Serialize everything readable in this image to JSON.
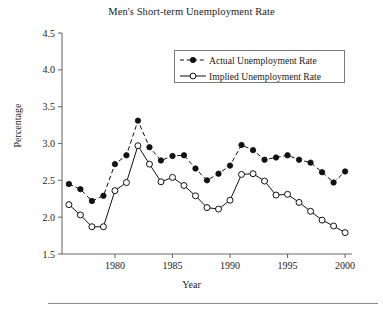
{
  "figure": {
    "title": "Men's Short-term Unemployment Rate",
    "xlabel": "Year",
    "ylabel": "Percentage"
  },
  "legend": {
    "position": "upper-right-inside",
    "entries": [
      {
        "label": "Actual Unemployment Rate",
        "marker": "filled-circle",
        "line": "dashed"
      },
      {
        "label": "Implied Unemployment Rate",
        "marker": "open-circle",
        "line": "solid"
      }
    ]
  },
  "axes": {
    "y_ticks": [
      "1.5",
      "2.0",
      "2.5",
      "3.0",
      "3.5",
      "4.0",
      "4.5"
    ],
    "x_ticks": [
      "1980",
      "1985",
      "1990",
      "1995",
      "2000"
    ]
  },
  "chart_data": {
    "type": "line",
    "title": "Men's Short-term Unemployment Rate",
    "xlabel": "Year",
    "ylabel": "Percentage",
    "xlim": [
      1975.4,
      2000.6
    ],
    "ylim": [
      1.5,
      4.5
    ],
    "grid": false,
    "legend_position": "upper right",
    "x": [
      1976,
      1977,
      1978,
      1979,
      1980,
      1981,
      1982,
      1983,
      1984,
      1985,
      1986,
      1987,
      1988,
      1989,
      1990,
      1991,
      1992,
      1993,
      1994,
      1995,
      1996,
      1997,
      1998,
      1999,
      2000
    ],
    "series": [
      {
        "name": "Actual Unemployment Rate",
        "marker": "filled-circle",
        "linestyle": "dashed",
        "color": "#111111",
        "values": [
          2.45,
          2.38,
          2.22,
          2.29,
          2.72,
          2.84,
          3.31,
          2.95,
          2.77,
          2.83,
          2.84,
          2.66,
          2.5,
          2.59,
          2.7,
          2.98,
          2.91,
          2.78,
          2.81,
          2.84,
          2.78,
          2.74,
          2.61,
          2.47,
          2.62
        ]
      },
      {
        "name": "Implied Unemployment Rate",
        "marker": "open-circle",
        "linestyle": "solid",
        "color": "#111111",
        "values": [
          2.17,
          2.03,
          1.87,
          1.87,
          2.36,
          2.47,
          2.97,
          2.72,
          2.48,
          2.54,
          2.43,
          2.29,
          2.13,
          2.11,
          2.23,
          2.58,
          2.59,
          2.49,
          2.3,
          2.31,
          2.2,
          2.08,
          1.96,
          1.88,
          1.79
        ]
      }
    ]
  }
}
